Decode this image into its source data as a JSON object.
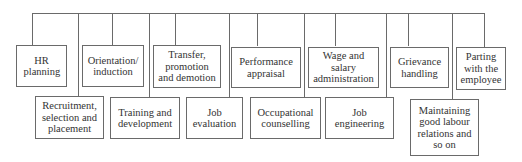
{
  "diagram": {
    "type": "org-chart",
    "top_row": [
      {
        "label": "HR planning"
      },
      {
        "label": "Orientation/ induction"
      },
      {
        "label": "Transfer, promotion and demotion"
      },
      {
        "label": "Performance appraisal"
      },
      {
        "label": "Wage and salary administration"
      },
      {
        "label": "Grievance handling"
      },
      {
        "label": "Parting with the employee"
      }
    ],
    "bottom_row": [
      {
        "label": "Recruitment, selection and placement"
      },
      {
        "label": "Training and development"
      },
      {
        "label": "Job evaluation"
      },
      {
        "label": "Occupational counselling"
      },
      {
        "label": "Job engineering"
      },
      {
        "label": "Maintaining good labour relations and so on"
      }
    ]
  }
}
